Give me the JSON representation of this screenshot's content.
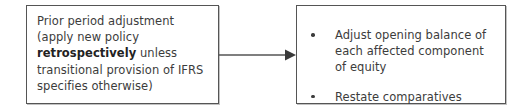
{
  "diagram": {
    "type": "flowchart",
    "orientation": "left-to-right",
    "background_color": "#ffffff",
    "border_color": "#555555",
    "text_color": "#3c3c3c",
    "nodes": [
      {
        "id": "source",
        "shape": "rectangle",
        "text_before_emphasis": "Prior period adjustment\n(apply new policy\n",
        "emphasis": "retrospectively",
        "text_after_emphasis": " unless\ntransitional provision of IFRS\nspecifies otherwise)",
        "full_text": "Prior period adjustment (apply new policy retrospectively unless transitional provision of IFRS specifies otherwise)"
      },
      {
        "id": "target",
        "shape": "rectangle",
        "bullets": [
          "Adjust opening balance of each affected component of equity",
          "Restate comparatives"
        ]
      }
    ],
    "connector": {
      "from": "source",
      "to": "target",
      "style": "solid-line-with-arrowhead",
      "direction": "right",
      "color": "#555555"
    }
  }
}
